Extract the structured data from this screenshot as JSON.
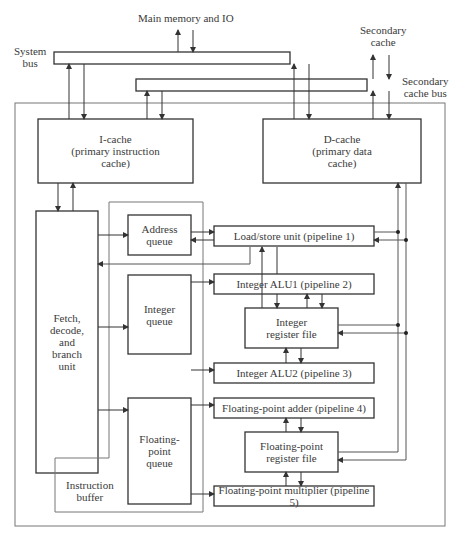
{
  "labels": {
    "main_memory": "Main memory and IO",
    "system_bus": "System\nbus",
    "secondary_cache": "Secondary\ncache",
    "secondary_cache_bus": "Secondary\ncache bus",
    "instruction_buffer": "Instruction\nbuffer"
  },
  "blocks": {
    "icache": "I-cache\n(primary instruction\ncache)",
    "dcache": "D-cache\n(primary data\ncache)",
    "fetch": "Fetch,\ndecode,\nand\nbranch\nunit",
    "address_queue": "Address\nqueue",
    "integer_queue": "Integer\nqueue",
    "fp_queue": "Floating-\npoint\nqueue",
    "load_store": "Load/store unit (pipeline 1)",
    "int_alu1": "Integer ALU1 (pipeline 2)",
    "int_regfile": "Integer\nregister file",
    "int_alu2": "Integer ALU2 (pipeline 3)",
    "fp_adder": "Floating-point adder (pipeline 4)",
    "fp_regfile": "Floating-point\nregister file",
    "fp_mult": "Floating-point multiplier (pipeline 5)"
  },
  "colors": {
    "line": "#3a3a3a",
    "thin": "#777777"
  }
}
